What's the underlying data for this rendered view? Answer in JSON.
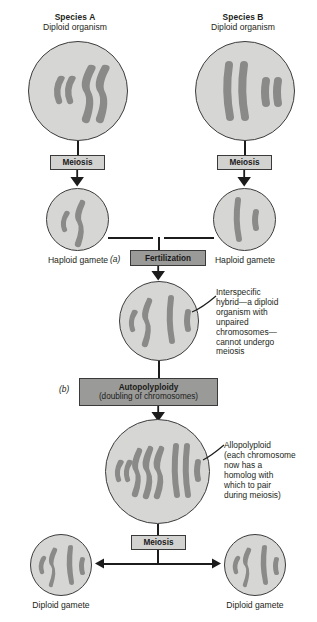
{
  "diagram": {
    "type": "biology-process-diagram"
  },
  "species_a": {
    "name": "Species A",
    "subtitle": "Diploid organism",
    "chromosomes": "2 short curved + 2 long curved"
  },
  "species_b": {
    "name": "Species B",
    "subtitle": "Diploid organism",
    "chromosomes": "2 long straight + 2 short straight"
  },
  "steps": {
    "meiosis_left": "Meiosis",
    "meiosis_right": "Meiosis",
    "meiosis_bottom": "Meiosis",
    "fertilization": "Fertilization",
    "autopolyploidy_title": "Autopolyploidy",
    "autopolyploidy_sub": "(doubling of chromosomes)"
  },
  "markers": {
    "a": "(a)",
    "b": "(b)"
  },
  "gametes": {
    "haploid_left": "Haploid gamete",
    "haploid_right": "Haploid gamete",
    "diploid_left": "Diploid gamete",
    "diploid_right": "Diploid gamete"
  },
  "annotations": {
    "hybrid": "Interspecific hybrid—a diploid organism with unpaired chromosomes—cannot undergo meiosis",
    "allopolyploid": "Allopolyploid (each chromosome now has a homolog with which to pair during meiosis)"
  },
  "annotation_lines": {
    "hybrid": [
      "Interspecific",
      "hybrid—a diploid",
      "organism with",
      "unpaired",
      "chromosomes—",
      "cannot undergo",
      "meiosis"
    ],
    "allopolyploid": [
      "Allopolyploid",
      "(each chromosome",
      "now has a",
      "homolog with",
      "which to pair",
      "during meiosis)"
    ]
  },
  "colors": {
    "cell_fill": "#d6d6d4",
    "cell_stroke": "#3c3c3c",
    "chromosome": "#8a8a88",
    "box_light": "#d2d2d0",
    "box_mid": "#9a9a98",
    "line": "#1c1c1c",
    "text": "#231f20"
  }
}
